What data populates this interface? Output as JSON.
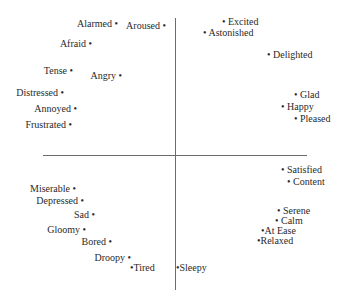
{
  "diagram": {
    "type": "circumplex-model-of-affect",
    "axes": {
      "vertical": {
        "x": 175,
        "y1": 18,
        "y2": 290,
        "color": "#6b6b6b"
      },
      "horizontal": {
        "y": 155,
        "x1": 43,
        "x2": 307,
        "color": "#6b6b6b"
      }
    },
    "labels": [
      {
        "text": "Alarmed •",
        "side": "left",
        "x": 118,
        "y": 24
      },
      {
        "text": "Aroused •",
        "side": "left",
        "x": 166,
        "y": 26
      },
      {
        "text": "Afraid •",
        "side": "left",
        "x": 92,
        "y": 44
      },
      {
        "text": "Tense •",
        "side": "left",
        "x": 73,
        "y": 71
      },
      {
        "text": "Angry •",
        "side": "left",
        "x": 122,
        "y": 76
      },
      {
        "text": "Distressed •",
        "side": "left",
        "x": 64,
        "y": 93
      },
      {
        "text": "Annoyed •",
        "side": "left",
        "x": 77,
        "y": 109
      },
      {
        "text": "Frustrated •",
        "side": "left",
        "x": 72,
        "y": 125
      },
      {
        "text": "• Excited",
        "side": "right",
        "x": 222,
        "y": 22
      },
      {
        "text": "• Astonished",
        "side": "right",
        "x": 203,
        "y": 33
      },
      {
        "text": "• Delighted",
        "side": "right",
        "x": 267,
        "y": 55
      },
      {
        "text": "• Glad",
        "side": "right",
        "x": 294,
        "y": 95
      },
      {
        "text": "• Happy",
        "side": "right",
        "x": 281,
        "y": 107
      },
      {
        "text": "• Pleased",
        "side": "right",
        "x": 294,
        "y": 119
      },
      {
        "text": "• Satisfied",
        "side": "right",
        "x": 281,
        "y": 170
      },
      {
        "text": "• Content",
        "side": "right",
        "x": 287,
        "y": 182
      },
      {
        "text": "Miserable •",
        "side": "left",
        "x": 76,
        "y": 189
      },
      {
        "text": "Depressed •",
        "side": "left",
        "x": 84,
        "y": 201
      },
      {
        "text": "Sad •",
        "side": "left",
        "x": 95,
        "y": 215
      },
      {
        "text": "Gloomy •",
        "side": "left",
        "x": 86,
        "y": 230
      },
      {
        "text": "Bored •",
        "side": "left",
        "x": 112,
        "y": 242
      },
      {
        "text": "Droopy •",
        "side": "left",
        "x": 131,
        "y": 258
      },
      {
        "text": "•Tired",
        "side": "right",
        "x": 130,
        "y": 268
      },
      {
        "text": "•Sleepy",
        "side": "right",
        "x": 176,
        "y": 268
      },
      {
        "text": "• Serene",
        "side": "right",
        "x": 277,
        "y": 211
      },
      {
        "text": "• Calm",
        "side": "right",
        "x": 275,
        "y": 221
      },
      {
        "text": "•At Ease",
        "side": "right",
        "x": 261,
        "y": 231
      },
      {
        "text": "•Relaxed",
        "side": "right",
        "x": 257,
        "y": 241
      }
    ]
  }
}
